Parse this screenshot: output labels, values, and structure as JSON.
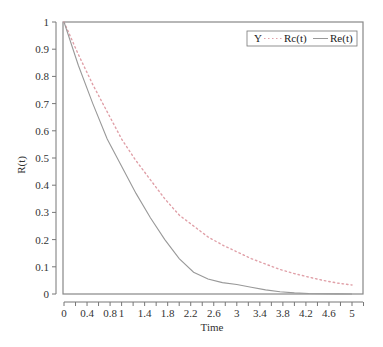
{
  "chart_data": {
    "type": "line",
    "title": "",
    "xlabel": "Time",
    "ylabel": "R(t)",
    "xlim": [
      0,
      5
    ],
    "ylim": [
      0,
      1
    ],
    "grid": false,
    "legend_position": "top-right",
    "x_ticks": [
      "0",
      "0.4",
      "0.8",
      "1",
      "1.4",
      "1.8",
      "2.2",
      "2.6",
      "3",
      "3.4",
      "3.8",
      "4.2",
      "4.6",
      "5"
    ],
    "x_tick_values": [
      0,
      0.4,
      0.8,
      1,
      1.4,
      1.8,
      2.2,
      2.6,
      3,
      3.4,
      3.8,
      4.2,
      4.6,
      5
    ],
    "y_ticks": [
      "0",
      "0.1",
      "0.2",
      "0.3",
      "0.4",
      "0.5",
      "0.6",
      "0.7",
      "0.8",
      "0.9",
      "1"
    ],
    "y_tick_values": [
      0,
      0.1,
      0.2,
      0.3,
      0.4,
      0.5,
      0.6,
      0.7,
      0.8,
      0.9,
      1
    ],
    "legend_title": "Y",
    "x": [
      0,
      0.25,
      0.5,
      0.75,
      1,
      1.25,
      1.5,
      1.75,
      2,
      2.25,
      2.5,
      2.75,
      3,
      3.25,
      3.5,
      3.75,
      4,
      4.25,
      4.5,
      4.75,
      5
    ],
    "series": [
      {
        "name": "Rc(t)",
        "style": "dotted",
        "color": "#e0a0a8",
        "values": [
          1.0,
          0.88,
          0.77,
          0.67,
          0.57,
          0.49,
          0.42,
          0.35,
          0.29,
          0.25,
          0.21,
          0.18,
          0.155,
          0.13,
          0.11,
          0.09,
          0.075,
          0.062,
          0.05,
          0.04,
          0.033
        ]
      },
      {
        "name": "Re(t)",
        "style": "solid",
        "color": "#999999",
        "values": [
          1.0,
          0.84,
          0.7,
          0.57,
          0.47,
          0.37,
          0.28,
          0.2,
          0.13,
          0.08,
          0.055,
          0.042,
          0.035,
          0.025,
          0.015,
          0.008,
          0.004,
          0.002,
          0.001,
          0.0005,
          0.0
        ]
      }
    ]
  },
  "legend": {
    "title": "Y",
    "items": [
      {
        "label": "Rc(t)"
      },
      {
        "label": "Re(t)"
      }
    ]
  },
  "axes": {
    "xlabel": "Time",
    "ylabel": "R(t)"
  }
}
